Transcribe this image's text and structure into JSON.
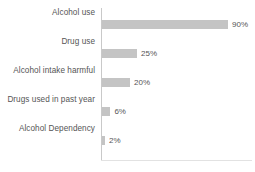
{
  "chart_data": {
    "type": "bar",
    "orientation": "horizontal",
    "title": "",
    "subtitle": "",
    "xlabel": "",
    "ylabel": "",
    "categories": [
      "Alcohol use",
      "Drug use",
      "Alcohol intake harmful",
      "Drugs used in past year",
      "Alcohol Dependency"
    ],
    "values": [
      90,
      25,
      20,
      6,
      2
    ],
    "value_labels": [
      "90%",
      "25%",
      "20%",
      "6%",
      "2%"
    ],
    "unit": "%",
    "xlim": [
      0,
      100
    ],
    "grid": false,
    "legend": null,
    "legend_position": "none",
    "series": [
      {
        "name": "",
        "values": [
          90,
          25,
          20,
          6,
          2
        ]
      }
    ],
    "colors": {
      "bar": "#c4c4c4",
      "axis": "#c9c9c9",
      "axis_bottom": "#e2e2e2",
      "text": "#555555",
      "background": "#ffffff"
    }
  }
}
